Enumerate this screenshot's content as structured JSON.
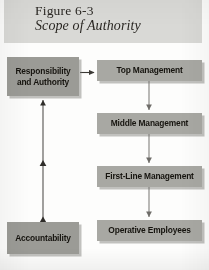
{
  "figure": {
    "number_label": "Figure 6-3",
    "title": "Scope of Authority"
  },
  "nodes": {
    "responsibility": {
      "line1": "Responsibility",
      "line2": "and Authority"
    },
    "accountability": {
      "label": "Accountability"
    },
    "top_management": {
      "label": "Top Management"
    },
    "middle_management": {
      "label": "Middle Management"
    },
    "first_line_management": {
      "label": "First-Line Management"
    },
    "operative_employees": {
      "label": "Operative Employees"
    }
  },
  "colors": {
    "title_band": "#d9d9d6",
    "node_left": "#9b9b96",
    "node_right": "#a8a8a3",
    "text": "#16140f",
    "connector": "#3b3935",
    "page": "#fdfdfc"
  },
  "connectors": [
    {
      "name": "responsibility-to-top-management",
      "from": "responsibility",
      "to": "top_management",
      "direction": "right",
      "arrowheads": "single"
    },
    {
      "name": "top-to-middle-management",
      "from": "top_management",
      "to": "middle_management",
      "direction": "down",
      "arrowheads": "single"
    },
    {
      "name": "middle-to-first-line-management",
      "from": "middle_management",
      "to": "first_line_management",
      "direction": "down",
      "arrowheads": "single"
    },
    {
      "name": "first-line-to-operative-employees",
      "from": "first_line_management",
      "to": "operative_employees",
      "direction": "down",
      "arrowheads": "single"
    },
    {
      "name": "accountability-to-responsibility",
      "from": "accountability",
      "to": "responsibility",
      "direction": "up",
      "arrowheads": "double-with-midpoint"
    }
  ]
}
